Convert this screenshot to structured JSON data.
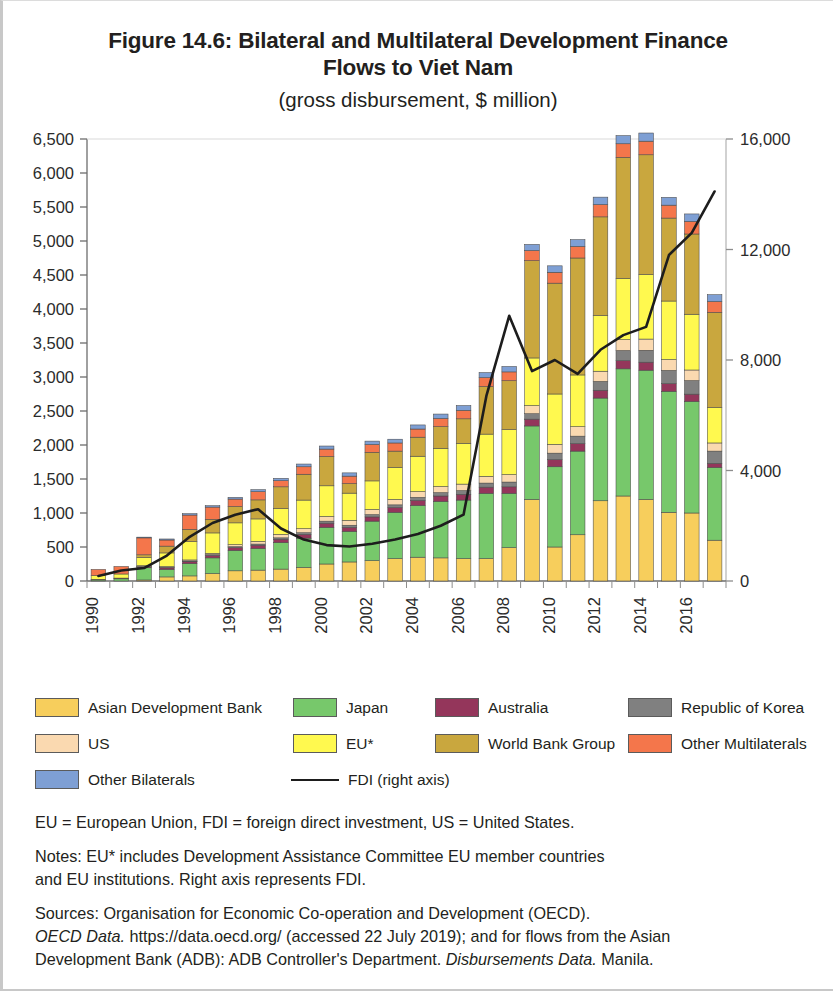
{
  "title": {
    "main_line1": "Figure 14.6: Bilateral and Multilateral Development Finance",
    "main_line2": "Flows to Viet Nam",
    "subtitle": "(gross disbursement, $ million)"
  },
  "notes": {
    "abbrev": "EU = European Union, FDI = foreign direct investment, US = United States.",
    "note_line1": "Notes: EU* includes Development Assistance Committee EU member countries",
    "note_line2": "and EU institutions. Right axis represents FDI.",
    "sources_line1": "Sources: Organisation for Economic Co-operation and Development (OECD).",
    "sources_line2a": "OECD Data.",
    "sources_line2b": " https://data.oecd.org/ (accessed 22 July 2019); and for flows from the Asian",
    "sources_line3a": "Development Bank (ADB): ADB Controller's Department. ",
    "sources_line3b": "Disbursements Data.",
    "sources_line3c": " Manila."
  },
  "legend": {
    "items": [
      {
        "label": "Asian Development Bank",
        "color": "#F7CE5C",
        "type": "swatch"
      },
      {
        "label": "Japan",
        "color": "#77C86B",
        "type": "swatch"
      },
      {
        "label": "Australia",
        "color": "#94365B",
        "type": "swatch"
      },
      {
        "label": "Republic of Korea",
        "color": "#808080",
        "type": "swatch"
      },
      {
        "label": "US",
        "color": "#FAD9B0",
        "type": "swatch"
      },
      {
        "label": "EU*",
        "color": "#FFF94F",
        "type": "swatch"
      },
      {
        "label": "World Bank Group",
        "color": "#C9A73E",
        "type": "swatch"
      },
      {
        "label": "Other Multilaterals",
        "color": "#F4764B",
        "type": "swatch"
      },
      {
        "label": "Other Bilaterals",
        "color": "#7E9FD4",
        "type": "swatch"
      },
      {
        "label": "FDI (right axis)",
        "color": "#1d1d1d",
        "type": "line"
      }
    ]
  },
  "chart_data": {
    "type": "bar",
    "stacked": true,
    "title": "Figure 14.6: Bilateral and Multilateral Development Finance Flows to Viet Nam",
    "subtitle": "(gross disbursement, $ million)",
    "xlabel": "",
    "ylabel": "",
    "grid": false,
    "legend_position": "bottom",
    "categories": [
      1990,
      1991,
      1992,
      1993,
      1994,
      1995,
      1996,
      1997,
      1998,
      1999,
      2000,
      2001,
      2002,
      2003,
      2004,
      2005,
      2006,
      2007,
      2008,
      2009,
      2010,
      2011,
      2012,
      2013,
      2014,
      2015,
      2016,
      2017
    ],
    "xtick_labels": [
      "1990",
      "",
      "1992",
      "",
      "1994",
      "",
      "1996",
      "",
      "1998",
      "",
      "2000",
      "",
      "2002",
      "",
      "2004",
      "",
      "2006",
      "",
      "2008",
      "",
      "2010",
      "",
      "2012",
      "",
      "2014",
      "",
      "2016",
      ""
    ],
    "ylim": [
      0,
      6500
    ],
    "ytick_labels": [
      "0",
      "500",
      "1,000",
      "1,500",
      "2,000",
      "2,500",
      "3,000",
      "3,500",
      "4,000",
      "4,500",
      "5,000",
      "5,500",
      "6,000",
      "6,500"
    ],
    "ylim_right": [
      0,
      16000
    ],
    "ytick_labels_right": [
      "0",
      "4,000",
      "8,000",
      "12,000",
      "16,000"
    ],
    "series": [
      {
        "name": "Asian Development Bank",
        "color": "#F7CE5C",
        "values": [
          0,
          0,
          15,
          60,
          75,
          110,
          150,
          160,
          175,
          200,
          250,
          280,
          300,
          330,
          350,
          340,
          330,
          330,
          490,
          1200,
          500,
          680,
          1180,
          1250,
          1200,
          1010,
          1000,
          600
        ]
      },
      {
        "name": "Japan",
        "color": "#77C86B",
        "values": [
          20,
          35,
          180,
          110,
          180,
          230,
          300,
          320,
          390,
          430,
          540,
          450,
          580,
          680,
          760,
          830,
          860,
          960,
          800,
          1080,
          1180,
          1230,
          1510,
          1870,
          1900,
          1780,
          1640,
          1070
        ]
      },
      {
        "name": "Australia",
        "color": "#94365B",
        "values": [
          5,
          8,
          20,
          25,
          30,
          35,
          40,
          45,
          50,
          55,
          60,
          58,
          62,
          70,
          75,
          80,
          85,
          90,
          95,
          100,
          105,
          110,
          115,
          120,
          118,
          112,
          108,
          60
        ]
      },
      {
        "name": "Republic of Korea",
        "color": "#808080",
        "values": [
          0,
          0,
          5,
          8,
          10,
          12,
          15,
          18,
          20,
          25,
          30,
          32,
          35,
          40,
          45,
          50,
          55,
          60,
          70,
          80,
          95,
          110,
          130,
          150,
          175,
          195,
          200,
          180
        ]
      },
      {
        "name": "US",
        "color": "#FAD9B0",
        "values": [
          0,
          0,
          5,
          10,
          15,
          20,
          30,
          40,
          50,
          60,
          70,
          72,
          75,
          80,
          85,
          90,
          95,
          100,
          110,
          120,
          130,
          140,
          150,
          160,
          165,
          160,
          155,
          120
        ]
      },
      {
        "name": "EU*",
        "color": "#FFF94F",
        "values": [
          55,
          60,
          120,
          200,
          270,
          300,
          320,
          330,
          380,
          420,
          450,
          400,
          420,
          470,
          520,
          560,
          600,
          620,
          660,
          700,
          740,
          760,
          820,
          900,
          950,
          860,
          820,
          520
        ]
      },
      {
        "name": "World Bank Group",
        "color": "#C9A73E",
        "values": [
          0,
          0,
          40,
          100,
          180,
          200,
          240,
          280,
          320,
          380,
          430,
          140,
          420,
          240,
          280,
          320,
          360,
          700,
          720,
          1430,
          1630,
          1720,
          1450,
          1780,
          1760,
          1220,
          1180,
          1400
        ]
      },
      {
        "name": "Other Multilaterals",
        "color": "#F4764B",
        "values": [
          90,
          110,
          250,
          90,
          210,
          180,
          110,
          120,
          90,
          110,
          110,
          110,
          115,
          120,
          120,
          120,
          125,
          130,
          130,
          150,
          160,
          170,
          180,
          200,
          200,
          190,
          185,
          160
        ]
      },
      {
        "name": "Other Bilaterals",
        "color": "#7E9FD4",
        "values": [
          0,
          0,
          10,
          15,
          20,
          20,
          25,
          30,
          35,
          40,
          45,
          48,
          50,
          55,
          60,
          65,
          70,
          75,
          80,
          90,
          95,
          100,
          110,
          120,
          120,
          115,
          110,
          100
        ]
      }
    ],
    "line_series": {
      "name": "FDI (right axis)",
      "color": "#1d1d1d",
      "axis": "right",
      "values": [
        180,
        380,
        470,
        920,
        1600,
        2100,
        2400,
        2600,
        1900,
        1500,
        1300,
        1250,
        1350,
        1500,
        1700,
        2000,
        2400,
        6700,
        9600,
        7600,
        8000,
        7500,
        8370,
        8900,
        9200,
        11800,
        12600,
        14100
      ]
    }
  }
}
